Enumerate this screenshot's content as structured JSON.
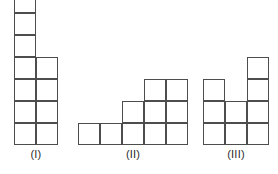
{
  "diagram": {
    "cell_size_px": 22,
    "baseline_y_px": 145,
    "stroke_color": "#4d4d4d",
    "cell_fill_color": "#ffffff",
    "background_color": "#ffffff",
    "label_color": "#2b2b2b",
    "figures": [
      {
        "id": "figure-1",
        "label": "(I)",
        "origin_x_px": 14,
        "columns": 2,
        "rows": 7,
        "cell_count": 11,
        "label_x_px": 14,
        "label_width_px": 44,
        "label_y_px": 148,
        "cells": [
          {
            "col": 0,
            "row": 0
          },
          {
            "col": 0,
            "row": 1
          },
          {
            "col": 0,
            "row": 2
          },
          {
            "col": 0,
            "row": 3
          },
          {
            "col": 1,
            "row": 3
          },
          {
            "col": 0,
            "row": 4
          },
          {
            "col": 1,
            "row": 4
          },
          {
            "col": 0,
            "row": 5
          },
          {
            "col": 1,
            "row": 5
          },
          {
            "col": 0,
            "row": 6
          },
          {
            "col": 1,
            "row": 6
          }
        ]
      },
      {
        "id": "figure-2",
        "label": "(II)",
        "origin_x_px": 78,
        "columns": 5,
        "rows": 3,
        "cell_count": 10,
        "label_x_px": 78,
        "label_width_px": 110,
        "label_y_px": 148,
        "cells": [
          {
            "col": 3,
            "row": 0
          },
          {
            "col": 4,
            "row": 0
          },
          {
            "col": 2,
            "row": 1
          },
          {
            "col": 3,
            "row": 1
          },
          {
            "col": 4,
            "row": 1
          },
          {
            "col": 0,
            "row": 2
          },
          {
            "col": 1,
            "row": 2
          },
          {
            "col": 2,
            "row": 2
          },
          {
            "col": 3,
            "row": 2
          },
          {
            "col": 4,
            "row": 2
          }
        ]
      },
      {
        "id": "figure-3",
        "label": "(III)",
        "origin_x_px": 203,
        "columns": 3,
        "rows": 4,
        "cell_count": 9,
        "label_x_px": 203,
        "label_width_px": 66,
        "label_y_px": 148,
        "cells": [
          {
            "col": 2,
            "row": 0
          },
          {
            "col": 0,
            "row": 1
          },
          {
            "col": 2,
            "row": 1
          },
          {
            "col": 0,
            "row": 2
          },
          {
            "col": 1,
            "row": 2
          },
          {
            "col": 2,
            "row": 2
          },
          {
            "col": 0,
            "row": 3
          },
          {
            "col": 1,
            "row": 3
          },
          {
            "col": 2,
            "row": 3
          }
        ]
      }
    ]
  }
}
